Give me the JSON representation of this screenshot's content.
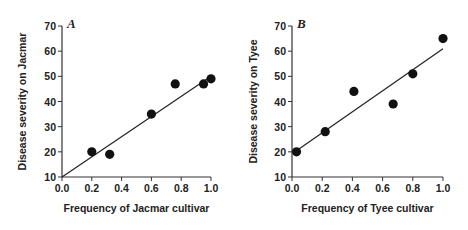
{
  "chart_data": [
    {
      "type": "scatter",
      "panel_label": "A",
      "title": "",
      "xlabel": "Frequency of Jacmar cultivar",
      "ylabel": "Disease severity on Jacmar",
      "xlim": [
        0.0,
        1.0
      ],
      "ylim": [
        10,
        70
      ],
      "xticks": [
        "0.0",
        "0.2",
        "0.4",
        "0.6",
        "0.8",
        "1.0"
      ],
      "yticks": [
        "10",
        "20",
        "30",
        "40",
        "50",
        "60",
        "70"
      ],
      "grid": false,
      "points": [
        {
          "x": 0.2,
          "y": 20
        },
        {
          "x": 0.32,
          "y": 19
        },
        {
          "x": 0.6,
          "y": 35
        },
        {
          "x": 0.76,
          "y": 47
        },
        {
          "x": 0.95,
          "y": 47
        },
        {
          "x": 1.0,
          "y": 49
        }
      ],
      "regression_line": {
        "x0": 0.0,
        "y0": 10,
        "x1": 1.0,
        "y1": 50
      }
    },
    {
      "type": "scatter",
      "panel_label": "B",
      "title": "",
      "xlabel": "Frequency of Tyee cultivar",
      "ylabel": "Disease severity on Tyee",
      "xlim": [
        0.0,
        1.0
      ],
      "ylim": [
        10,
        70
      ],
      "xticks": [
        "0.0",
        "0.2",
        "0.4",
        "0.6",
        "0.8",
        "1.0"
      ],
      "yticks": [
        "10",
        "20",
        "30",
        "40",
        "50",
        "60",
        "70"
      ],
      "grid": false,
      "points": [
        {
          "x": 0.03,
          "y": 20
        },
        {
          "x": 0.22,
          "y": 28
        },
        {
          "x": 0.41,
          "y": 44
        },
        {
          "x": 0.67,
          "y": 39
        },
        {
          "x": 0.8,
          "y": 51
        },
        {
          "x": 1.0,
          "y": 65
        }
      ],
      "regression_line": {
        "x0": 0.02,
        "y0": 20,
        "x1": 1.0,
        "y1": 61
      }
    }
  ]
}
